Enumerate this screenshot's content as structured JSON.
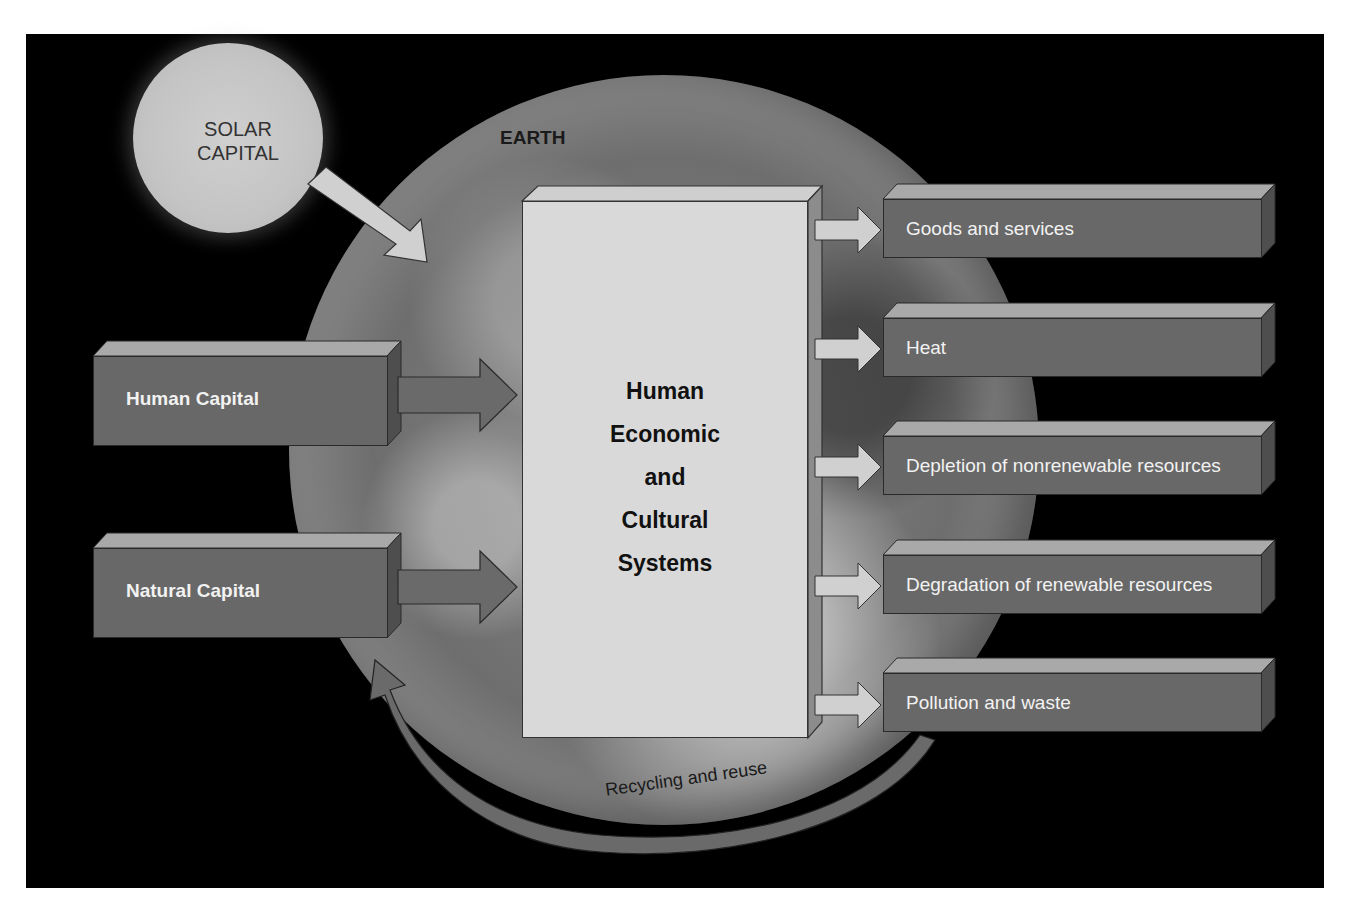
{
  "diagram": {
    "title": "Human Economic and Cultural Systems",
    "solar": {
      "label_line1": "SOLAR",
      "label_line2": "CAPITAL"
    },
    "earth": {
      "label": "EARTH"
    },
    "inputs": [
      {
        "label": "Human Capital"
      },
      {
        "label": "Natural Capital"
      }
    ],
    "center": {
      "lines": [
        "Human",
        "Economic",
        "and",
        "Cultural",
        "Systems"
      ]
    },
    "outputs": [
      {
        "label": "Goods and services"
      },
      {
        "label": "Heat"
      },
      {
        "label": "Depletion of nonrenewable resources"
      },
      {
        "label": "Degradation of renewable resources"
      },
      {
        "label": "Pollution and waste"
      }
    ],
    "feedback": {
      "label": "Recycling and reuse"
    },
    "colors": {
      "background": "#000000",
      "box_face": "#686868",
      "box_top": "#a9a9a9",
      "center_face": "#d9d9d9",
      "arrow_light": "#d0d0d0",
      "arrow_dark": "#6a6a6a"
    }
  }
}
